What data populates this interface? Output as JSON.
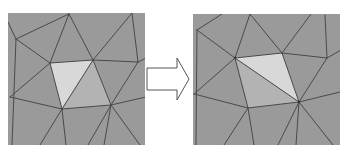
{
  "figure": {
    "colors": {
      "background": "#9a9a9a",
      "edge": "#4a4a4a",
      "highlight_light": "#d8d8d8",
      "highlight_medium": "#b3b3b3",
      "arrow_fill": "#ffffff",
      "arrow_stroke": "#555555"
    },
    "panels": [
      {
        "id": "before",
        "quad_label": "highlighted quadrilateral before flip",
        "diagonal": "top-right to bottom-left"
      },
      {
        "id": "after",
        "quad_label": "highlighted quadrilateral after flip",
        "diagonal": "top-left to bottom-right"
      }
    ],
    "arrow": {
      "direction": "right",
      "meaning": "transform"
    }
  }
}
